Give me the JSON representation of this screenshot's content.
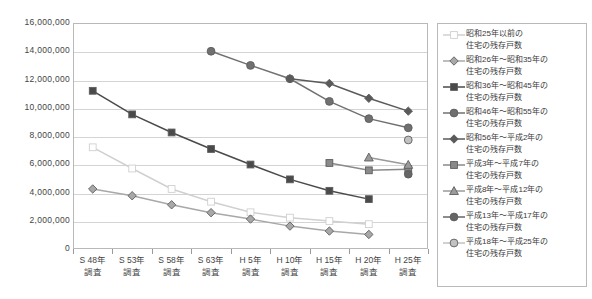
{
  "chart_data": {
    "type": "line",
    "title": "",
    "xlabel": "",
    "ylabel": "",
    "ylim": [
      0,
      16000000
    ],
    "ytick_step": 2000000,
    "grid": true,
    "legend_position": "right",
    "categories": [
      "S48年\n調査",
      "S53年\n調査",
      "S58年\n調査",
      "S63年\n調査",
      "H5年\n調査",
      "H10年\n調査",
      "H15年\n調査",
      "H20年\n調査",
      "H25年\n調査"
    ],
    "ytick_labels": [
      "16,000,000",
      "14,000,000",
      "12,000,000",
      "10,000,000",
      "8,000,000",
      "6,000,000",
      "4,000,000",
      "2,000,000",
      "0"
    ],
    "ytick_values": [
      16000000,
      14000000,
      12000000,
      10000000,
      8000000,
      6000000,
      4000000,
      2000000,
      0
    ],
    "series": [
      {
        "name": "昭和25年以前の住宅の残存戸数",
        "name_line1": "昭和25年以前の",
        "name_line2": "住宅の残存戸数",
        "marker": "square-open",
        "color": "#d0d0d0",
        "values": [
          7200000,
          5700000,
          4250000,
          3350000,
          2600000,
          2220000,
          1980000,
          1760000,
          null
        ]
      },
      {
        "name": "昭和26年～昭和35年の住宅の残存戸数",
        "name_line1": "昭和26年～昭和35年の",
        "name_line2": "住宅の残存戸数",
        "marker": "diamond",
        "color": "#a8a8a8",
        "values": [
          4250000,
          3770000,
          3130000,
          2570000,
          2120000,
          1620000,
          1270000,
          1030000,
          null
        ]
      },
      {
        "name": "昭和36年～昭和45年の住宅の残存戸数",
        "name_line1": "昭和36年～昭和45年の",
        "name_line2": "住宅の残存戸数",
        "marker": "square",
        "color": "#4a4a4a",
        "values": [
          11200000,
          9530000,
          8250000,
          7080000,
          5980000,
          4930000,
          4120000,
          3530000,
          null
        ]
      },
      {
        "name": "昭和46年～昭和55年の住宅の残存戸数",
        "name_line1": "昭和46年～昭和55年の",
        "name_line2": "住宅の残存戸数",
        "marker": "circle",
        "color": "#707070",
        "values": [
          null,
          null,
          null,
          14000000,
          13000000,
          12050000,
          10450000,
          9230000,
          8580000
        ]
      },
      {
        "name": "昭和56年～平成2年の住宅の残存戸数",
        "name_line1": "昭和56年～平成2年の",
        "name_line2": "住宅の残存戸数",
        "marker": "diamond",
        "color": "#5a5a5a",
        "values": [
          null,
          null,
          null,
          null,
          null,
          12050000,
          11720000,
          10670000,
          9760000
        ]
      },
      {
        "name": "平成3年～平成7年の住宅の残存戸数",
        "name_line1": "平成3年～平成7年の",
        "name_line2": "住宅の残存戸数",
        "marker": "square",
        "color": "#8a8a8a",
        "values": [
          null,
          null,
          null,
          null,
          null,
          null,
          6090000,
          5570000,
          5650000
        ]
      },
      {
        "name": "平成8年～平成12年の住宅の残存戸数",
        "name_line1": "平成8年～平成12年の",
        "name_line2": "住宅の残存戸数",
        "marker": "triangle",
        "color": "#9a9a9a",
        "values": [
          null,
          null,
          null,
          null,
          null,
          null,
          null,
          6480000,
          5960000
        ]
      },
      {
        "name": "平成13年～平成17年の住宅の残存戸数",
        "name_line1": "平成13年～平成17年の",
        "name_line2": "住宅の残存戸数",
        "marker": "circle",
        "color": "#666666",
        "values": [
          null,
          null,
          null,
          null,
          null,
          null,
          null,
          null,
          5300000
        ]
      },
      {
        "name": "平成18年～平成25年の住宅の残存戸数",
        "name_line1": "平成18年～平成25年の",
        "name_line2": "住宅の残存戸数",
        "marker": "circle",
        "color": "#c2c2c2",
        "values": [
          null,
          null,
          null,
          null,
          null,
          null,
          null,
          null,
          7720000
        ]
      }
    ]
  },
  "legend": {
    "items": [
      {
        "line1": "昭和25年以前の",
        "line2": "住宅の残存戸数"
      },
      {
        "line1": "昭和26年～昭和35年の",
        "line2": "住宅の残存戸数"
      },
      {
        "line1": "昭和36年～昭和45年の",
        "line2": "住宅の残存戸数"
      },
      {
        "line1": "昭和46年～昭和55年の",
        "line2": "住宅の残存戸数"
      },
      {
        "line1": "昭和56年～平成2年の",
        "line2": "住宅の残存戸数"
      },
      {
        "line1": "平成3年～平成7年の",
        "line2": "住宅の残存戸数"
      },
      {
        "line1": "平成8年～平成12年の",
        "line2": "住宅の残存戸数"
      },
      {
        "line1": "平成13年～平成17年の",
        "line2": "住宅の残存戸数"
      },
      {
        "line1": "平成18年～平成25年の",
        "line2": "住宅の残存戸数"
      }
    ]
  },
  "axis": {
    "x_labels": [
      {
        "line1": "S 48年",
        "line2": "調査"
      },
      {
        "line1": "S 53年",
        "line2": "調査"
      },
      {
        "line1": "S 58年",
        "line2": "調査"
      },
      {
        "line1": "S 63年",
        "line2": "調査"
      },
      {
        "line1": "H 5年",
        "line2": "調査"
      },
      {
        "line1": "H 10年",
        "line2": "調査"
      },
      {
        "line1": "H 15年",
        "line2": "調査"
      },
      {
        "line1": "H 20年",
        "line2": "調査"
      },
      {
        "line1": "H 25年",
        "line2": "調査"
      }
    ]
  },
  "colors": {
    "plot_border": "#b9b9b9",
    "gridline": "#d4d4d4",
    "axis_text": "#444444",
    "background": "#ffffff"
  }
}
